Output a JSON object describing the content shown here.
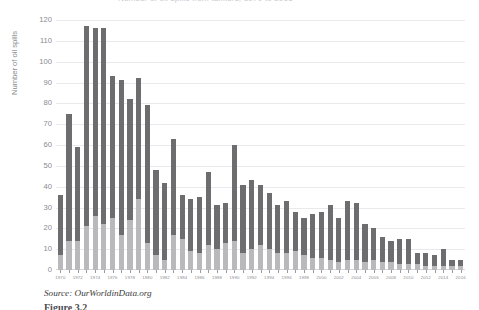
{
  "figure": {
    "title_cropped": "Number of oil spills from tankers, 1970 to 2016",
    "source_text": "Source: OurWorldinData.org",
    "caption_text": "Figure 3.2"
  },
  "colors": {
    "segment_lower": "#b9b9bb",
    "segment_upper": "#6d6d70",
    "gridline": "#e9e9ec",
    "axis_text": "#8a8a8f"
  },
  "chart_data": {
    "type": "bar",
    "stacked": true,
    "title": "Number of oil spills from tankers, 1970 to 2016",
    "xlabel": "",
    "ylabel": "Number of oil spills",
    "ylim": [
      0,
      120
    ],
    "ystep": 10,
    "grid": true,
    "legend_position": "none",
    "yticks": [
      "0",
      "10",
      "20",
      "30",
      "40",
      "50",
      "60",
      "70",
      "80",
      "90",
      "100",
      "110",
      "120"
    ],
    "xticks": [
      "1970",
      "1972",
      "1974",
      "1976",
      "1978",
      "1980",
      "1982",
      "1984",
      "1986",
      "1988",
      "1990",
      "1992",
      "1994",
      "1996",
      "1998",
      "2000",
      "2002",
      "2004",
      "2006",
      "2008",
      "2010",
      "2012",
      "2014",
      "2016"
    ],
    "categories": [
      "1970",
      "1971",
      "1972",
      "1973",
      "1974",
      "1975",
      "1976",
      "1977",
      "1978",
      "1979",
      "1980",
      "1981",
      "1982",
      "1983",
      "1984",
      "1985",
      "1986",
      "1987",
      "1988",
      "1989",
      "1990",
      "1991",
      "1992",
      "1993",
      "1994",
      "1995",
      "1996",
      "1997",
      "1998",
      "1999",
      "2000",
      "2001",
      "2002",
      "2003",
      "2004",
      "2005",
      "2006",
      "2007",
      "2008",
      "2009",
      "2010",
      "2011",
      "2012",
      "2013",
      "2014",
      "2015",
      "2016"
    ],
    "series": [
      {
        "name": "Medium spills (7-700 tonnes)",
        "color": "#b9b9bb",
        "values": [
          7,
          14,
          14,
          21,
          26,
          22,
          25,
          17,
          24,
          34,
          13,
          7,
          5,
          17,
          15,
          9,
          8,
          12,
          10,
          13,
          14,
          8,
          10,
          12,
          10,
          8,
          8,
          9,
          7,
          6,
          6,
          5,
          4,
          5,
          5,
          4,
          5,
          4,
          4,
          3,
          3,
          3,
          2,
          2,
          2,
          2,
          2
        ]
      },
      {
        "name": "Large spills (>700 tonnes)",
        "color": "#6d6d70",
        "values": [
          29,
          61,
          45,
          96,
          90,
          94,
          68,
          74,
          58,
          58,
          66,
          41,
          37,
          46,
          21,
          25,
          27,
          35,
          21,
          19,
          46,
          33,
          33,
          29,
          27,
          23,
          25,
          19,
          18,
          21,
          22,
          26,
          21,
          28,
          27,
          18,
          15,
          12,
          10,
          12,
          12,
          5,
          6,
          5,
          8,
          3,
          3
        ]
      }
    ],
    "totals": [
      36,
      75,
      59,
      117,
      116,
      116,
      93,
      91,
      82,
      92,
      79,
      48,
      42,
      63,
      36,
      34,
      35,
      47,
      31,
      32,
      60,
      41,
      43,
      41,
      37,
      31,
      33,
      28,
      25,
      27,
      28,
      31,
      25,
      33,
      32,
      22,
      20,
      16,
      14,
      15,
      15,
      8,
      8,
      7,
      10,
      5,
      5
    ]
  }
}
